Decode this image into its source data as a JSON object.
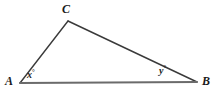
{
  "figure": {
    "kind": "triangle-diagram",
    "width": 217,
    "height": 100,
    "background_color": "#ffffff"
  },
  "style": {
    "base_line_color": "#6b6b6b",
    "base_line_width": 2,
    "side_line_color": "#3a3a3a",
    "side_line_width": 1.4,
    "text_color": "#1a1a1a"
  },
  "vertices": [
    {
      "id": "A",
      "label": "A",
      "x": 20,
      "y": 83
    },
    {
      "id": "B",
      "label": "B",
      "x": 197,
      "y": 82
    },
    {
      "id": "C",
      "label": "C",
      "x": 68,
      "y": 21
    }
  ],
  "sides": [
    {
      "id": "AB",
      "from": "A",
      "to": "B",
      "role": "base",
      "x1": 20,
      "y1": 83,
      "x2": 197,
      "y2": 82
    },
    {
      "id": "AC",
      "from": "A",
      "to": "C",
      "role": "left-leg",
      "x1": 20,
      "y1": 83,
      "x2": 68,
      "y2": 21
    },
    {
      "id": "CB",
      "from": "C",
      "to": "B",
      "role": "right-leg",
      "x1": 68,
      "y1": 21,
      "x2": 197,
      "y2": 82
    }
  ],
  "angles": [
    {
      "id": "x",
      "at_vertex": "A",
      "variable": "x",
      "degree_symbol": "°",
      "text": "x°"
    },
    {
      "id": "y",
      "at_vertex": "B",
      "variable": "y",
      "degree_symbol": "°",
      "text": "y°"
    }
  ],
  "labels": {
    "vertex_a": "A",
    "vertex_b": "B",
    "vertex_c": "C",
    "angle_x_variable": "x",
    "angle_x_degree": "°",
    "angle_y_variable": "y",
    "angle_y_degree": "°"
  }
}
